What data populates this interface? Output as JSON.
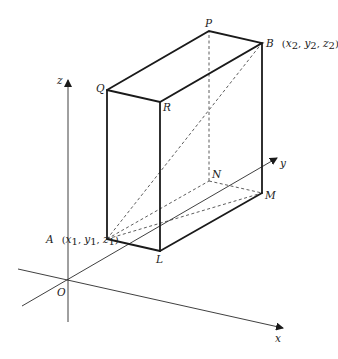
{
  "figure": {
    "type": "3D cuboid in coordinate axes",
    "axes": {
      "x": {
        "label": "x"
      },
      "y": {
        "label": "y"
      },
      "z": {
        "label": "z"
      },
      "origin": {
        "label": "O"
      }
    },
    "vertices": {
      "A": {
        "label": "A",
        "coords": "(x₁, y₁, z₁)"
      },
      "B": {
        "label": "B",
        "coords": "(x₂, y₂, z₂)"
      },
      "P": {
        "label": "P"
      },
      "Q": {
        "label": "Q"
      },
      "R": {
        "label": "R"
      },
      "L": {
        "label": "L"
      },
      "M": {
        "label": "M"
      },
      "N": {
        "label": "N"
      }
    },
    "hidden_edges": [
      "A-N",
      "N-M",
      "N-P",
      "A-B diagonal",
      "A-M diagonal"
    ],
    "colors": {
      "line": "#1a1a1a",
      "background": "#ffffff"
    }
  }
}
